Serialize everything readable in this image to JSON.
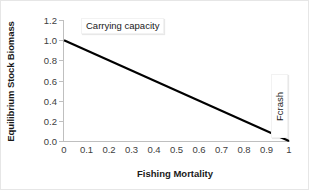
{
  "chart_data": {
    "type": "line",
    "title": "",
    "xlabel": "Fishing Mortality",
    "ylabel": "Equilibrium Stock Biomass",
    "xlim": [
      0,
      1
    ],
    "ylim": [
      0,
      1.2
    ],
    "grid": false,
    "legend": "none",
    "x": [
      0,
      1
    ],
    "series": [
      {
        "name": "Equilibrium stock biomass",
        "values": [
          1.0,
          0.0
        ],
        "color": "#000000"
      }
    ],
    "xticks": [
      "0",
      "0.1",
      "0.2",
      "0.3",
      "0.4",
      "0.5",
      "0.6",
      "0.7",
      "0.8",
      "0.9",
      "1"
    ],
    "xtick_values": [
      0,
      0.1,
      0.2,
      0.3,
      0.4,
      0.5,
      0.6,
      0.7,
      0.8,
      0.9,
      1
    ],
    "yticks": [
      "0.0",
      "0.2",
      "0.4",
      "0.6",
      "0.8",
      "1.0",
      "1.2"
    ],
    "ytick_values": [
      0.0,
      0.2,
      0.4,
      0.6,
      0.8,
      1.0,
      1.2
    ],
    "annotations": [
      {
        "label": "Carrying capacity",
        "x": 0.0,
        "y": 1.0,
        "orientation": "horizontal"
      },
      {
        "label": "Fcrash",
        "x": 1.0,
        "y": 0.0,
        "orientation": "vertical"
      }
    ],
    "colors": {
      "line": "#000000",
      "axis": "#bfbfbf",
      "tick_text": "#404040",
      "axis_title": "#1a1a1a",
      "background": "#ffffff",
      "border": "#e6e6e6"
    }
  }
}
